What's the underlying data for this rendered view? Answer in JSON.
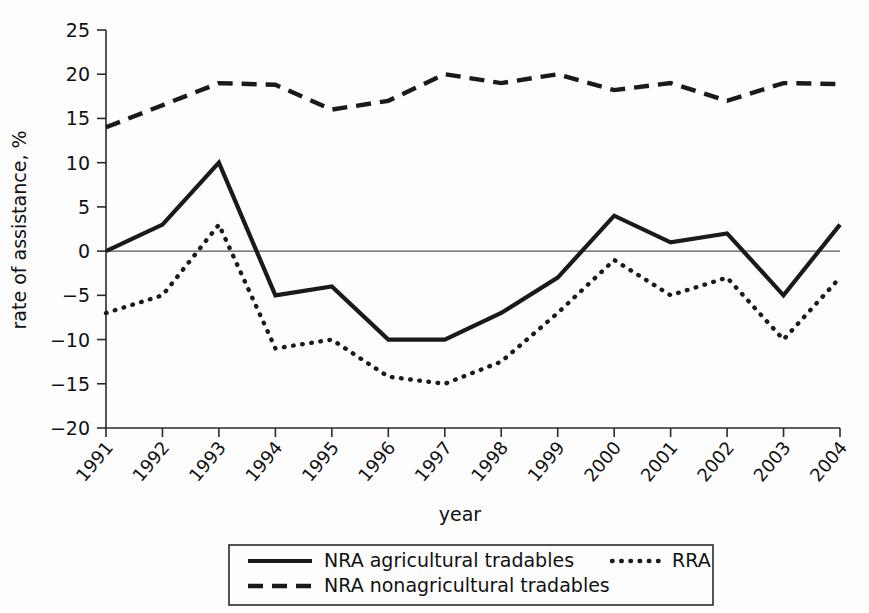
{
  "chart_data": {
    "type": "line",
    "title": "",
    "xlabel": "year",
    "ylabel": "rate of assistance, %",
    "grid": false,
    "legend_position": "bottom",
    "categories": [
      "1991",
      "1992",
      "1993",
      "1994",
      "1995",
      "1996",
      "1997",
      "1998",
      "1999",
      "2000",
      "2001",
      "2002",
      "2003",
      "2004"
    ],
    "x": [
      1991,
      1992,
      1993,
      1994,
      1995,
      1996,
      1997,
      1998,
      1999,
      2000,
      2001,
      2002,
      2003,
      2004
    ],
    "xlim": [
      1991,
      2004
    ],
    "ylim": [
      -20,
      25
    ],
    "ytick_labels": [
      "25",
      "20",
      "15",
      "10",
      "5",
      "0",
      "−5",
      "−10",
      "−15",
      "−20"
    ],
    "yticks": [
      25,
      20,
      15,
      10,
      5,
      0,
      -5,
      -10,
      -15,
      -20
    ],
    "zero_line": 0,
    "series": [
      {
        "name": "NRA agricultural tradables",
        "style": "solid",
        "values": [
          0,
          3,
          10,
          -5,
          -4,
          -10,
          -10,
          -7,
          -3,
          4,
          1,
          2,
          -5,
          3
        ]
      },
      {
        "name": "NRA nonagricultural tradables",
        "style": "dashed",
        "values": [
          14,
          16.5,
          19,
          18.8,
          16,
          17,
          20,
          19,
          20,
          18.2,
          19,
          17,
          19,
          18.9
        ]
      },
      {
        "name": "RRA",
        "style": "dotted",
        "values": [
          -7,
          -5,
          3,
          -11,
          -10,
          -14.2,
          -15,
          -12.5,
          -7,
          -1,
          -5,
          -3,
          -10,
          -3
        ]
      }
    ]
  },
  "legend": {
    "items": [
      {
        "label": "NRA agricultural tradables",
        "style": "solid"
      },
      {
        "label": "NRA nonagricultural tradables",
        "style": "dashed"
      },
      {
        "label": "RRA",
        "style": "dotted"
      }
    ]
  },
  "colors": {
    "ink": "#1a1a1a",
    "axis": "#2a2a2a",
    "background": "#fdfdfd",
    "zero_line": "#555555"
  }
}
